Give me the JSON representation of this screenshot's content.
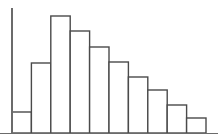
{
  "chart_data": {
    "type": "bar",
    "title": "",
    "subtitle": "",
    "xlabel": "",
    "ylabel": "",
    "categories": [
      "1",
      "2",
      "3",
      "4",
      "5",
      "6",
      "7",
      "8",
      "9",
      "10"
    ],
    "values": [
      21,
      70,
      117,
      102,
      86,
      71,
      56,
      43,
      28,
      15
    ],
    "tick_labels_x": [],
    "tick_labels_y": [],
    "ylim": [
      0,
      125
    ],
    "grid": false,
    "legend": null,
    "legend_position": "none",
    "annotations": [],
    "style": {
      "bar_fill": "#ffffff",
      "bar_stroke": "#4a4a4a",
      "axis_color": "#6b6b6b",
      "background": "#ffffff",
      "bar_gap": 0
    },
    "geometry": {
      "baseline_y": 133,
      "axis_x": 12,
      "axis_top_y": 8,
      "plot_left": 12,
      "plot_right": 206,
      "bar_width": 19.4
    }
  }
}
